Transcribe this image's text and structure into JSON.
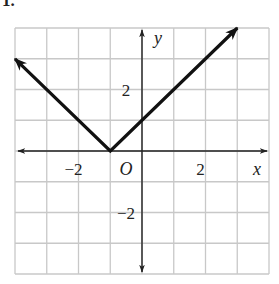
{
  "problem": {
    "number": "1."
  },
  "chart_data": {
    "type": "line",
    "title": "",
    "equation_implied": "y = |x + 1|",
    "xlabel": "x",
    "ylabel": "y",
    "origin_label": "O",
    "xlim": [
      -4,
      4
    ],
    "ylim": [
      -4,
      4
    ],
    "grid": true,
    "grid_step": 1,
    "x_tick_labels": [
      {
        "value": -2,
        "label": "−2"
      },
      {
        "value": 2,
        "label": "2"
      }
    ],
    "y_tick_labels": [
      {
        "value": 2,
        "label": "2"
      },
      {
        "value": -2,
        "label": "−2"
      }
    ],
    "series": [
      {
        "name": "absolute value graph",
        "points": [
          [
            -4,
            3
          ],
          [
            -1,
            0
          ],
          [
            3,
            4
          ]
        ],
        "arrows_at_ends": true,
        "color": "#111111"
      }
    ],
    "vertex": [
      -1,
      0
    ],
    "y_intercept": 1
  },
  "colors": {
    "grid": "#c8c8c8",
    "axis": "#222222",
    "graph": "#111111"
  }
}
